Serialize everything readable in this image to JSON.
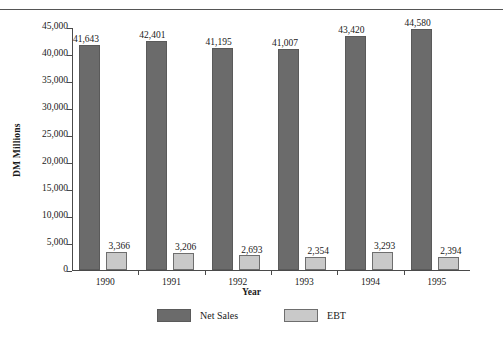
{
  "chart_data": {
    "type": "bar",
    "title": "",
    "subtitle": "",
    "xlabel": "Year",
    "ylabel": "DM Millions",
    "categories": [
      "1990",
      "1991",
      "1992",
      "1993",
      "1994",
      "1995"
    ],
    "series": [
      {
        "name": "Net Sales",
        "color": "#6b6b6b",
        "values": [
          41643,
          42401,
          41195,
          41007,
          43420,
          44580
        ],
        "labels": [
          "41,643",
          "42,401",
          "41,195",
          "41,007",
          "43,420",
          "44,580"
        ]
      },
      {
        "name": "EBT",
        "color": "#c9c9c9",
        "values": [
          3366,
          3206,
          2693,
          2354,
          3293,
          2394
        ],
        "labels": [
          "3,366",
          "3,206",
          "2,693",
          "2,354",
          "3,293",
          "2,394"
        ]
      }
    ],
    "ylim": [
      0,
      45000
    ],
    "ytick_values": [
      0,
      5000,
      10000,
      15000,
      20000,
      25000,
      30000,
      35000,
      40000,
      45000
    ],
    "ytick_labels": [
      "0",
      "5,000",
      "10,000",
      "15,000",
      "20,000",
      "25,000",
      "30,000",
      "35,000",
      "40,000",
      "45,000"
    ],
    "grid": false,
    "legend_position": "bottom",
    "legend_entries": [
      "Net Sales",
      "EBT"
    ]
  }
}
